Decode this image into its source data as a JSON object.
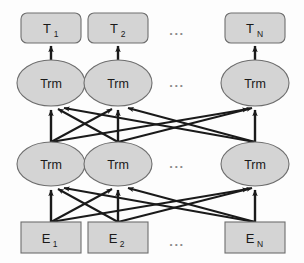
{
  "diagram": {
    "colors": {
      "node_fill": "#d4d4d4",
      "node_stroke": "#6e6e6e",
      "arrow": "#1a1a1a",
      "background": "#fdfdfd",
      "text": "#1a1a1a",
      "ellipsis": "#8a8a8a"
    },
    "ellipsis_text": "...",
    "rows": {
      "output": {
        "name": "output-token-row",
        "shape": "rounded-rect",
        "nodes": [
          {
            "base": "T",
            "sub": "1"
          },
          {
            "base": "T",
            "sub": "2"
          },
          {
            "base": "T",
            "sub": "N"
          }
        ]
      },
      "upper_transformer": {
        "name": "upper-transformer-row",
        "shape": "ellipse",
        "nodes": [
          {
            "label": "Trm"
          },
          {
            "label": "Trm"
          },
          {
            "label": "Trm"
          }
        ]
      },
      "lower_transformer": {
        "name": "lower-transformer-row",
        "shape": "ellipse",
        "nodes": [
          {
            "label": "Trm"
          },
          {
            "label": "Trm"
          },
          {
            "label": "Trm"
          }
        ]
      },
      "input": {
        "name": "input-embedding-row",
        "shape": "rect",
        "nodes": [
          {
            "base": "E",
            "sub": "1"
          },
          {
            "base": "E",
            "sub": "2"
          },
          {
            "base": "E",
            "sub": "N"
          }
        ]
      }
    },
    "geometry": {
      "columns_x": [
        51,
        118,
        255
      ],
      "ellipsis_x": 177,
      "output_box": {
        "y": 13,
        "w": 60,
        "h": 30,
        "r": 6
      },
      "upper_ellipse": {
        "cy": 83,
        "rx": 34,
        "ry": 23
      },
      "lower_ellipse": {
        "cy": 164,
        "rx": 34,
        "ry": 22
      },
      "input_box": {
        "y": 222,
        "w": 60,
        "h": 31
      },
      "ellipsis_y": {
        "output": 34,
        "upper": 86,
        "lower": 167,
        "input": 243
      }
    },
    "connections": {
      "vertical_out": "each upper Trm to its T box",
      "cross_upper": "every lower Trm to every upper Trm",
      "cross_lower": "every E box to every lower Trm"
    }
  }
}
